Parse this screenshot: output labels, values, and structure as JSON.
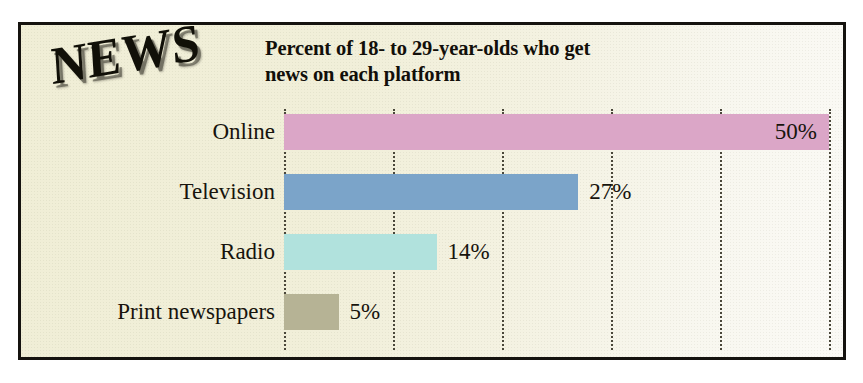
{
  "chart_data": {
    "type": "bar",
    "orientation": "horizontal",
    "title": "Percent of 18- to 29-year-olds who get news on each platform",
    "title_line1": "Percent of 18- to 29-year-olds who get",
    "title_line2": "news on each platform",
    "logo": "NEWS",
    "xlabel": "",
    "ylabel": "",
    "xlim": [
      0,
      50
    ],
    "grid": true,
    "grid_axis": "x",
    "gridline_style": "dotted",
    "gridline_values": [
      0,
      10,
      20,
      30,
      40,
      50
    ],
    "legend": "none",
    "value_suffix": "%",
    "categories": [
      "Online",
      "Television",
      "Radio",
      "Print newspapers"
    ],
    "values": [
      50,
      27,
      14,
      5
    ],
    "value_labels": [
      "50%",
      "27%",
      "14%",
      "5%"
    ],
    "label_placement": [
      "inside-end",
      "outside-end",
      "outside-end",
      "outside-end"
    ],
    "bar_colors": [
      "#dba6c7",
      "#7ba4c9",
      "#b1e2dd",
      "#b6b395"
    ],
    "bars": [
      {
        "category": "Online",
        "value": 50,
        "label": "50%",
        "color": "#dba6c7"
      },
      {
        "category": "Television",
        "value": 27,
        "label": "27%",
        "color": "#7ba4c9"
      },
      {
        "category": "Radio",
        "value": 14,
        "label": "14%",
        "color": "#b1e2dd"
      },
      {
        "category": "Print newspapers",
        "value": 5,
        "label": "5%",
        "color": "#b6b395"
      }
    ]
  },
  "style": {
    "background": "#f2f0da",
    "border_color": "#15130f",
    "text_color": "#17140d",
    "gridline_color": "#4a473a"
  }
}
